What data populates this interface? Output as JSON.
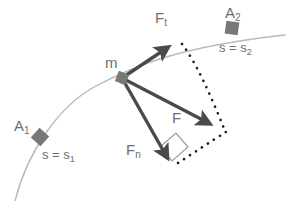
{
  "figure": {
    "background_color": "#ffffff",
    "colors": {
      "arrow": "#4a4a4a",
      "path_curve": "#b9b9b9",
      "dotted": "#1a1a1a",
      "marker_square": "#787878",
      "label_text": "#6e6e6e",
      "right_angle": "#9a9a9a"
    }
  },
  "labels": {
    "mass": {
      "text": "m",
      "x": 105,
      "y": 55
    },
    "force_tangential": {
      "base": "F",
      "sub": "t",
      "x": 155,
      "y": 10
    },
    "force_resultant": {
      "base": "F",
      "sub": "",
      "x": 172,
      "y": 110
    },
    "force_normal": {
      "base": "F",
      "sub": "n",
      "x": 126,
      "y": 142
    },
    "point_a1": {
      "base": "A",
      "sub": "1",
      "x": 14,
      "y": 118
    },
    "point_a2": {
      "base": "A",
      "sub": "2",
      "x": 225,
      "y": 5
    },
    "arc_length_1": {
      "prefix": "s = s",
      "sub": "1",
      "x": 42,
      "y": 148
    },
    "arc_length_2": {
      "prefix": "s = s",
      "sub": "2",
      "x": 219,
      "y": 41
    }
  },
  "geometry": {
    "origin": {
      "x": 122,
      "y": 78,
      "name": "mass-position"
    },
    "path_curve": "M 15 201 C 28 150, 60 105, 96 86 C 130 68, 175 47, 285 35",
    "vectors": [
      {
        "name": "force-tangential",
        "from": {
          "x": 122,
          "y": 78
        },
        "to": {
          "x": 176,
          "y": 42
        },
        "label": "F_t"
      },
      {
        "name": "force-resultant",
        "from": {
          "x": 122,
          "y": 78
        },
        "to": {
          "x": 218,
          "y": 128
        },
        "label": "F"
      },
      {
        "name": "force-normal",
        "from": {
          "x": 122,
          "y": 78
        },
        "to": {
          "x": 172,
          "y": 166
        },
        "label": "F_n"
      }
    ],
    "dotted_paths": [
      {
        "name": "dotted-tangential-to-resultant",
        "d": "M 182 44 C 196 62, 212 98, 225 131"
      },
      {
        "name": "dotted-normal-to-resultant",
        "d": "M 178 163 C 195 152, 213 140, 226 132"
      }
    ],
    "markers": [
      {
        "name": "marker-a1",
        "x": 40,
        "y": 137,
        "size": 13,
        "rotation": 42
      },
      {
        "name": "marker-mass",
        "x": 122,
        "y": 78,
        "size": 11,
        "rotation": 22
      },
      {
        "name": "marker-a2",
        "x": 232,
        "y": 28,
        "size": 13,
        "rotation": 8
      }
    ],
    "right_angle": {
      "name": "right-angle-marker",
      "points": "160,147 176,133 188,147 172,161"
    }
  }
}
